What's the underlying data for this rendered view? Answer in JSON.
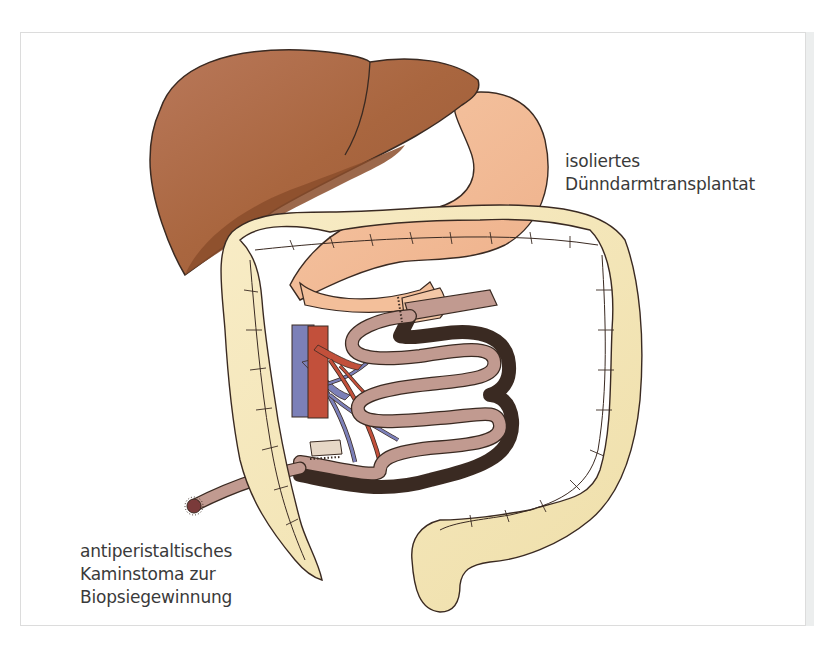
{
  "figure": {
    "labels": {
      "transplant": {
        "line1": "isoliertes",
        "line2": "Dünndarmtransplantat"
      },
      "stoma": {
        "line1": "antiperistaltisches",
        "line2": "Kaminstoma zur",
        "line3": "Biopsiegewinnung"
      }
    },
    "organs": [
      "liver-icon",
      "stomach-icon",
      "colon-icon",
      "small-intestine-graft-icon",
      "vein-icon",
      "artery-icon",
      "stoma-icon"
    ],
    "colors": {
      "liver": "#a9663f",
      "liver_shadow": "#8b4d2c",
      "stomach": "#f3bf9a",
      "colon": "#f4e6b8",
      "small_intestine": "#c19a90",
      "artery": "#c2503b",
      "vein": "#7c80b8",
      "outline": "#3a2a22",
      "text": "#3a3a3a",
      "frame": "#dcdcdc"
    }
  }
}
